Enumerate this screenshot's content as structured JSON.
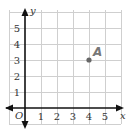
{
  "chart_data": {
    "type": "scatter",
    "title": "",
    "xlabel": "x",
    "ylabel": "y",
    "origin_label": "O",
    "xlim": [
      -1,
      6
    ],
    "ylim": [
      -1,
      6
    ],
    "grid": true,
    "x_ticks": [
      "1",
      "2",
      "3",
      "4",
      "5"
    ],
    "y_ticks": [
      "1",
      "2",
      "3",
      "4",
      "5"
    ],
    "points": [
      {
        "label": "A",
        "x": 4,
        "y": 3
      }
    ],
    "colors": {
      "grid": "#cfcfcf",
      "axis": "#111111",
      "point": "#666666",
      "point_label": "#777777"
    }
  }
}
